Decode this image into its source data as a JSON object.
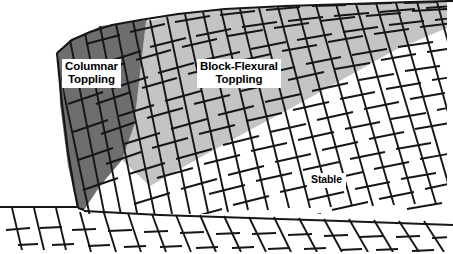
{
  "figure": {
    "background_color": "#ffffff",
    "width": 453,
    "height": 254
  },
  "labels": {
    "columnar": {
      "line1": "Columnar",
      "line2": "Toppling"
    },
    "block_flexural": {
      "line1": "Block-Flexural",
      "line2": "Toppling"
    },
    "stable": {
      "line1": "Stable"
    }
  },
  "zones": [
    {
      "name": "columnar-toppling-zone",
      "fill": "#6e6e6e",
      "label": "Columnar Toppling"
    },
    {
      "name": "block-flexural-toppling-zone",
      "fill": "#c4c4c4",
      "label": "Block-Flexural Toppling"
    },
    {
      "name": "stable-zone",
      "fill": "#ffffff",
      "label": "Stable"
    }
  ],
  "colors": {
    "dark_gray": "#6e6e6e",
    "light_gray": "#c4c4c4",
    "white": "#ffffff",
    "line": "#16161a"
  }
}
